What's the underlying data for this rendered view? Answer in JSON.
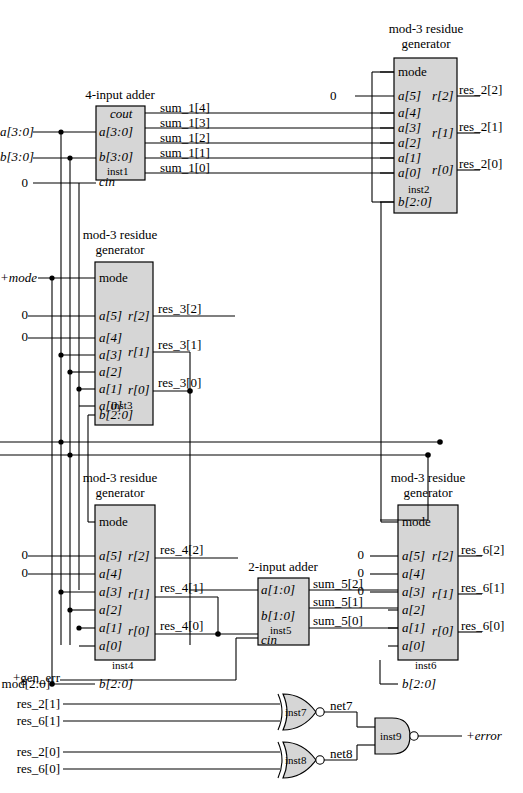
{
  "diagram": {
    "box_fill": "#d6d6d6",
    "line_color": "#000000"
  },
  "blocks": [
    {
      "id": "inst1",
      "title": "4-input adder",
      "instance": "inst1",
      "inputs": [
        "a[3:0]",
        "b[3:0]",
        "cin"
      ],
      "outputs": [
        "cout"
      ]
    },
    {
      "id": "inst2",
      "title_line1": "mod-3 residue",
      "title_line2": "generator",
      "instance": "inst2",
      "inputs": [
        "mode",
        "a[5]",
        "a[4]",
        "a[3]",
        "a[2]",
        "a[1]",
        "a[0]",
        "b[2:0]"
      ],
      "outputs": [
        "r[2]",
        "r[1]",
        "r[0]"
      ]
    },
    {
      "id": "inst3",
      "title_line1": "mod-3 residue",
      "title_line2": "generator",
      "instance": "inst3",
      "inputs": [
        "mode",
        "a[5]",
        "a[4]",
        "a[3]",
        "a[2]",
        "a[1]",
        "a[0]",
        "b[2:0]"
      ],
      "outputs": [
        "r[2]",
        "r[1]",
        "r[0]"
      ]
    },
    {
      "id": "inst4",
      "title_line1": "mod-3 residue",
      "title_line2": "generator",
      "instance": "inst4",
      "inputs": [
        "mode",
        "a[5]",
        "a[4]",
        "a[3]",
        "a[2]",
        "a[1]",
        "a[0]",
        "b[2:0]"
      ],
      "outputs": [
        "r[2]",
        "r[1]",
        "r[0]"
      ]
    },
    {
      "id": "inst5",
      "title": "2-input adder",
      "instance": "inst5",
      "inputs": [
        "a[1:0]",
        "b[1:0]",
        "cin"
      ],
      "outputs": []
    },
    {
      "id": "inst6",
      "title_line1": "mod-3 residue",
      "title_line2": "generator",
      "instance": "inst6",
      "inputs": [
        "mode",
        "a[5]",
        "a[4]",
        "a[3]",
        "a[2]",
        "a[1]",
        "a[0]",
        "b[2:0]"
      ],
      "outputs": [
        "r[2]",
        "r[1]",
        "r[0]"
      ]
    }
  ],
  "gates": [
    {
      "id": "inst7",
      "type": "xnor",
      "label": "inst7",
      "output_net": "net7",
      "inputs": [
        "res_2[1]",
        "res_6[1]"
      ]
    },
    {
      "id": "inst8",
      "type": "xnor",
      "label": "inst8",
      "output_net": "net8",
      "inputs": [
        "res_2[0]",
        "res_6[0]"
      ]
    },
    {
      "id": "inst9",
      "type": "nand",
      "label": "inst9",
      "output_net": "+error",
      "inputs": [
        "net7",
        "net8"
      ]
    }
  ],
  "labels": {
    "inst1_title": "4-input adder",
    "inst1_name": "inst1",
    "inst1_cout": "cout",
    "inst1_a": "a[3:0]",
    "inst1_b": "b[3:0]",
    "inst1_cin": "cin",
    "inst2_title1": "mod-3 residue",
    "inst2_title2": "generator",
    "inst2_name": "inst2",
    "inst3_title1": "mod-3 residue",
    "inst3_title2": "generator",
    "inst3_name": "inst3",
    "inst4_title1": "mod-3 residue",
    "inst4_title2": "generator",
    "inst4_name": "inst4",
    "inst5_title": "2-input adder",
    "inst5_name": "inst5",
    "inst5_a": "a[1:0]",
    "inst5_b": "b[1:0]",
    "inst5_cin": "cin",
    "inst6_title1": "mod-3 residue",
    "inst6_title2": "generator",
    "inst6_name": "inst6",
    "port_mode": "mode",
    "port_a5": "a[5]",
    "port_a4": "a[4]",
    "port_a3": "a[3]",
    "port_a2": "a[2]",
    "port_a1": "a[1]",
    "port_a0": "a[0]",
    "port_b20": "b[2:0]",
    "port_r2": "r[2]",
    "port_r1": "r[1]",
    "port_r0": "r[0]"
  },
  "signals": {
    "in_a": "a[3:0]",
    "in_b": "b[3:0]",
    "zero": "0",
    "in_mode": "+mode",
    "in_mod": "mod[2:0]",
    "in_gen_err": "+gen_err",
    "out_error": "+error",
    "sum_1_4": "sum_1[4]",
    "sum_1_3": "sum_1[3]",
    "sum_1_2": "sum_1[2]",
    "sum_1_1": "sum_1[1]",
    "sum_1_0": "sum_1[0]",
    "res_2_2": "res_2[2]",
    "res_2_1": "res_2[1]",
    "res_2_0": "res_2[0]",
    "res_3_2": "res_3[2]",
    "res_3_1": "res_3[1]",
    "res_3_0": "res_3[0]",
    "res_4_2": "res_4[2]",
    "res_4_1": "res_4[1]",
    "res_4_0": "res_4[0]",
    "res_6_2": "res_6[2]",
    "res_6_1": "res_6[1]",
    "res_6_0": "res_6[0]",
    "sum_5_2": "sum_5[2]",
    "sum_5_1": "sum_5[1]",
    "sum_5_0": "sum_5[0]",
    "net7": "net7",
    "net8": "net8",
    "gate_inst7": "inst7",
    "gate_inst8": "inst8",
    "gate_inst9": "inst9",
    "zero_inst2_a5": "0",
    "zero_inst3_a5": "0",
    "zero_inst3_a4": "0",
    "zero_inst4_a5": "0",
    "zero_inst4_a4": "0",
    "zero_inst6_a5": "0",
    "zero_inst6_a4": "0",
    "zero_inst6_a3": "0",
    "zero_inst1_cin": "0",
    "xnor_in_res_2_1": "res_2[1]",
    "xnor_in_res_6_1": "res_6[1]",
    "xnor_in_res_2_0": "res_2[0]",
    "xnor_in_res_6_0": "res_6[0]"
  }
}
